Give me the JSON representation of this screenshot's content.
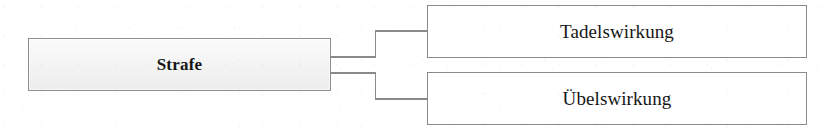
{
  "diagram": {
    "type": "tree",
    "orientation": "left-to-right",
    "title": "Strafe",
    "root": {
      "id": "strafe",
      "label": "Strafe",
      "style": "filled",
      "fill_color": "#f1f1f1",
      "border_color": "#8e8e8e",
      "text_color": "#161616",
      "bold": true
    },
    "children": [
      {
        "id": "tadelswirkung",
        "label": "Tadelswirkung",
        "style": "outline",
        "fill_color": "#ffffff",
        "border_color": "#8a8a8a",
        "text_color": "#161616",
        "bold": false
      },
      {
        "id": "uebelswirkung",
        "label": "Übelswirkung",
        "style": "outline",
        "fill_color": "#ffffff",
        "border_color": "#8a8a8a",
        "text_color": "#161616",
        "bold": false
      }
    ],
    "connectors": {
      "style": "orthogonal-elbow",
      "line_color": "#8a8a8a",
      "line_width": 1,
      "edges": [
        {
          "from": "strafe",
          "to": "tadelswirkung"
        },
        {
          "from": "strafe",
          "to": "uebelswirkung"
        }
      ]
    },
    "background_color": "#ffffff"
  }
}
